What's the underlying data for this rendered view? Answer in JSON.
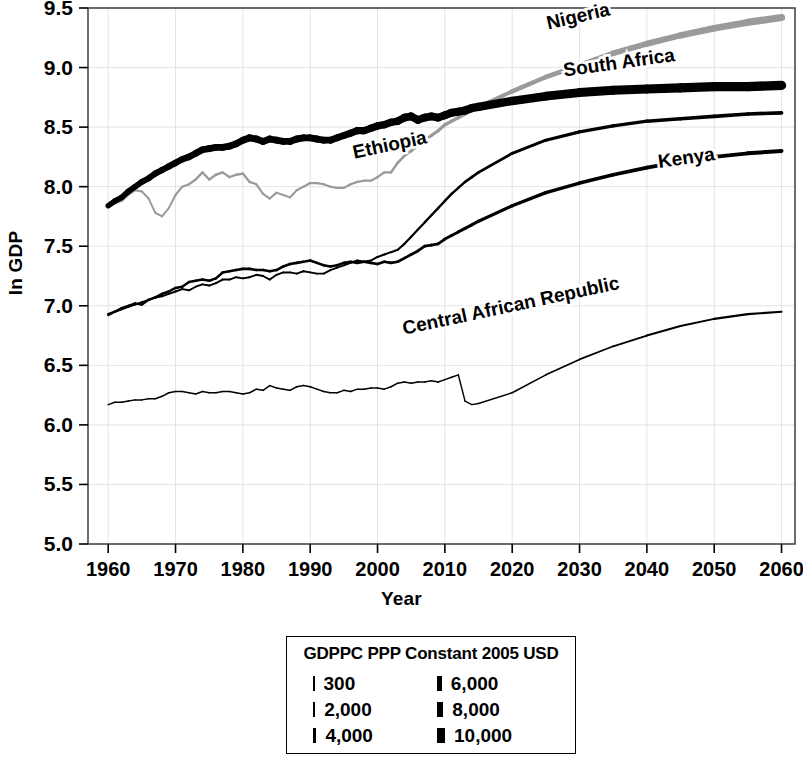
{
  "chart_data": {
    "type": "line",
    "title": "",
    "xlabel": "Year",
    "ylabel": "ln GDP",
    "xlim": [
      1957,
      2062
    ],
    "ylim": [
      5.0,
      9.5
    ],
    "xticks": [
      1960,
      1970,
      1980,
      1990,
      2000,
      2010,
      2020,
      2030,
      2040,
      2050,
      2060
    ],
    "yticks": [
      "5.0",
      "5.5",
      "6.0",
      "6.5",
      "7.0",
      "7.5",
      "8.0",
      "8.5",
      "9.0",
      "9.5"
    ],
    "grid": true,
    "legend_position": "below-plot",
    "encoding_note": "Line width encodes GDP per capita (PPP, constant 2005 USD); line color gray for Nigeria",
    "series": [
      {
        "name": "Nigeria",
        "color": "#9a9a9a",
        "label_x": 2030,
        "label_y": 9.38,
        "label_rotation": -13,
        "x": [
          1960,
          1961,
          1962,
          1963,
          1964,
          1965,
          1966,
          1967,
          1968,
          1969,
          1970,
          1971,
          1972,
          1973,
          1974,
          1975,
          1976,
          1977,
          1978,
          1979,
          1980,
          1981,
          1982,
          1983,
          1984,
          1985,
          1986,
          1987,
          1988,
          1989,
          1990,
          1991,
          1992,
          1993,
          1994,
          1995,
          1996,
          1997,
          1998,
          1999,
          2000,
          2001,
          2002,
          2003,
          2004,
          2005,
          2006,
          2007,
          2008,
          2009,
          2010,
          2011,
          2012,
          2013,
          2014,
          2015,
          2020,
          2025,
          2030,
          2035,
          2040,
          2045,
          2050,
          2055,
          2060
        ],
        "y": [
          7.83,
          7.86,
          7.88,
          7.93,
          7.97,
          7.96,
          7.9,
          7.78,
          7.75,
          7.82,
          7.93,
          8.0,
          8.02,
          8.06,
          8.12,
          8.06,
          8.1,
          8.12,
          8.08,
          8.1,
          8.11,
          8.04,
          8.02,
          7.94,
          7.9,
          7.95,
          7.93,
          7.91,
          7.97,
          8.0,
          8.03,
          8.03,
          8.02,
          8.0,
          7.99,
          7.99,
          8.02,
          8.04,
          8.05,
          8.05,
          8.08,
          8.12,
          8.12,
          8.2,
          8.26,
          8.3,
          8.35,
          8.39,
          8.43,
          8.47,
          8.52,
          8.55,
          8.58,
          8.61,
          8.64,
          8.67,
          8.8,
          8.92,
          9.02,
          9.12,
          9.2,
          9.27,
          9.33,
          9.38,
          9.42
        ],
        "widths": [
          2.0,
          2.0,
          2.0,
          2.1,
          2.1,
          2.1,
          2.0,
          1.9,
          1.9,
          2.0,
          2.1,
          2.2,
          2.2,
          2.3,
          2.4,
          2.3,
          2.4,
          2.4,
          2.3,
          2.4,
          2.4,
          2.3,
          2.2,
          2.1,
          2.0,
          2.1,
          2.1,
          2.0,
          2.1,
          2.2,
          2.2,
          2.2,
          2.2,
          2.1,
          2.1,
          2.1,
          2.2,
          2.2,
          2.2,
          2.2,
          2.3,
          2.4,
          2.4,
          2.6,
          2.7,
          2.8,
          2.9,
          3.0,
          3.1,
          3.2,
          3.3,
          3.4,
          3.5,
          3.6,
          3.7,
          3.8,
          4.2,
          4.6,
          5.0,
          5.4,
          5.8,
          6.2,
          6.6,
          7.0,
          7.4
        ]
      },
      {
        "name": "South Africa",
        "color": "#000000",
        "label_x": 2036,
        "label_y": 8.99,
        "label_rotation": -8,
        "x": [
          1960,
          1961,
          1962,
          1963,
          1964,
          1965,
          1966,
          1967,
          1968,
          1969,
          1970,
          1971,
          1972,
          1973,
          1974,
          1975,
          1976,
          1977,
          1978,
          1979,
          1980,
          1981,
          1982,
          1983,
          1984,
          1985,
          1986,
          1987,
          1988,
          1989,
          1990,
          1991,
          1992,
          1993,
          1994,
          1995,
          1996,
          1997,
          1998,
          1999,
          2000,
          2001,
          2002,
          2003,
          2004,
          2005,
          2006,
          2007,
          2008,
          2009,
          2010,
          2011,
          2012,
          2013,
          2014,
          2015,
          2020,
          2025,
          2030,
          2035,
          2040,
          2045,
          2050,
          2055,
          2060
        ],
        "y": [
          7.84,
          7.88,
          7.91,
          7.96,
          8.0,
          8.04,
          8.07,
          8.11,
          8.14,
          8.17,
          8.2,
          8.23,
          8.25,
          8.28,
          8.31,
          8.32,
          8.33,
          8.33,
          8.34,
          8.36,
          8.39,
          8.41,
          8.4,
          8.38,
          8.4,
          8.39,
          8.38,
          8.38,
          8.4,
          8.41,
          8.41,
          8.4,
          8.39,
          8.39,
          8.41,
          8.43,
          8.45,
          8.47,
          8.47,
          8.49,
          8.51,
          8.52,
          8.54,
          8.55,
          8.58,
          8.59,
          8.56,
          8.58,
          8.59,
          8.58,
          8.6,
          8.62,
          8.63,
          8.64,
          8.66,
          8.67,
          8.72,
          8.76,
          8.79,
          8.81,
          8.82,
          8.83,
          8.84,
          8.84,
          8.85
        ],
        "widths": [
          5.4,
          5.5,
          5.6,
          5.7,
          5.8,
          5.9,
          6.0,
          6.1,
          6.2,
          6.3,
          6.4,
          6.5,
          6.6,
          6.7,
          6.8,
          6.8,
          6.8,
          6.8,
          6.8,
          6.9,
          7.0,
          7.0,
          6.9,
          6.8,
          6.9,
          6.8,
          6.8,
          6.8,
          6.9,
          6.9,
          6.9,
          6.9,
          6.8,
          6.8,
          6.9,
          7.0,
          7.1,
          7.2,
          7.2,
          7.3,
          7.4,
          7.4,
          7.5,
          7.6,
          7.7,
          7.8,
          7.7,
          7.8,
          7.9,
          7.8,
          7.9,
          8.0,
          8.1,
          8.1,
          8.2,
          8.3,
          8.5,
          8.7,
          8.9,
          9.0,
          9.1,
          9.2,
          9.3,
          9.3,
          9.4
        ]
      },
      {
        "name": "Ethiopia",
        "color": "#000000",
        "label_x": 2002,
        "label_y": 8.3,
        "label_rotation": -12,
        "x": [
          1960,
          1961,
          1962,
          1963,
          1964,
          1965,
          1966,
          1967,
          1968,
          1969,
          1970,
          1971,
          1972,
          1973,
          1974,
          1975,
          1976,
          1977,
          1978,
          1979,
          1980,
          1981,
          1982,
          1983,
          1984,
          1985,
          1986,
          1987,
          1988,
          1989,
          1990,
          1991,
          1992,
          1993,
          1994,
          1995,
          1996,
          1997,
          1998,
          1999,
          2000,
          2001,
          2002,
          2003,
          2004,
          2005,
          2006,
          2007,
          2008,
          2009,
          2010,
          2011,
          2012,
          2013,
          2014,
          2015,
          2020,
          2025,
          2030,
          2035,
          2040,
          2045,
          2050,
          2055,
          2060
        ],
        "y": [
          6.92,
          6.95,
          6.97,
          6.99,
          7.01,
          7.03,
          7.05,
          7.07,
          7.08,
          7.1,
          7.12,
          7.14,
          7.13,
          7.16,
          7.18,
          7.17,
          7.19,
          7.22,
          7.22,
          7.24,
          7.23,
          7.24,
          7.26,
          7.25,
          7.22,
          7.26,
          7.28,
          7.28,
          7.27,
          7.29,
          7.28,
          7.27,
          7.27,
          7.3,
          7.32,
          7.34,
          7.36,
          7.38,
          7.37,
          7.38,
          7.41,
          7.43,
          7.45,
          7.47,
          7.52,
          7.58,
          7.64,
          7.7,
          7.76,
          7.82,
          7.88,
          7.94,
          7.99,
          8.04,
          8.08,
          8.12,
          8.28,
          8.39,
          8.46,
          8.51,
          8.55,
          8.57,
          8.59,
          8.61,
          8.62
        ],
        "widths": [
          1.9,
          1.9,
          1.9,
          1.9,
          1.9,
          1.9,
          1.9,
          1.9,
          1.9,
          1.9,
          1.9,
          1.9,
          1.9,
          1.9,
          1.9,
          1.9,
          1.9,
          1.9,
          1.9,
          1.9,
          1.9,
          1.9,
          1.9,
          1.9,
          1.9,
          1.9,
          1.9,
          1.9,
          1.9,
          1.9,
          1.9,
          1.9,
          1.9,
          1.9,
          1.9,
          1.9,
          2.0,
          2.0,
          2.0,
          2.0,
          2.0,
          2.0,
          2.0,
          2.1,
          2.1,
          2.2,
          2.2,
          2.3,
          2.3,
          2.4,
          2.4,
          2.5,
          2.5,
          2.6,
          2.6,
          2.7,
          2.9,
          3.1,
          3.2,
          3.3,
          3.4,
          3.5,
          3.6,
          3.6,
          3.7
        ]
      },
      {
        "name": "Kenya",
        "color": "#000000",
        "label_x": 2046,
        "label_y": 8.19,
        "label_rotation": -8,
        "x": [
          1960,
          1961,
          1962,
          1963,
          1964,
          1965,
          1966,
          1967,
          1968,
          1969,
          1970,
          1971,
          1972,
          1973,
          1974,
          1975,
          1976,
          1977,
          1978,
          1979,
          1980,
          1981,
          1982,
          1983,
          1984,
          1985,
          1986,
          1987,
          1988,
          1989,
          1990,
          1991,
          1992,
          1993,
          1994,
          1995,
          1996,
          1997,
          1998,
          1999,
          2000,
          2001,
          2002,
          2003,
          2004,
          2005,
          2006,
          2007,
          2008,
          2009,
          2010,
          2011,
          2012,
          2013,
          2014,
          2015,
          2020,
          2025,
          2030,
          2035,
          2040,
          2045,
          2050,
          2055,
          2060
        ],
        "y": [
          6.93,
          6.95,
          6.98,
          7.0,
          7.02,
          7.01,
          7.05,
          7.07,
          7.1,
          7.12,
          7.15,
          7.16,
          7.2,
          7.21,
          7.22,
          7.21,
          7.23,
          7.28,
          7.29,
          7.3,
          7.31,
          7.31,
          7.3,
          7.3,
          7.29,
          7.3,
          7.33,
          7.35,
          7.36,
          7.37,
          7.38,
          7.36,
          7.34,
          7.33,
          7.34,
          7.36,
          7.37,
          7.36,
          7.37,
          7.36,
          7.35,
          7.37,
          7.36,
          7.37,
          7.4,
          7.43,
          7.46,
          7.5,
          7.51,
          7.52,
          7.56,
          7.59,
          7.62,
          7.65,
          7.68,
          7.71,
          7.84,
          7.95,
          8.03,
          8.1,
          8.16,
          8.21,
          8.25,
          8.28,
          8.3
        ],
        "widths": [
          2.4,
          2.4,
          2.4,
          2.4,
          2.4,
          2.4,
          2.4,
          2.5,
          2.5,
          2.5,
          2.5,
          2.5,
          2.5,
          2.5,
          2.5,
          2.5,
          2.5,
          2.6,
          2.6,
          2.6,
          2.6,
          2.6,
          2.6,
          2.6,
          2.6,
          2.6,
          2.6,
          2.6,
          2.6,
          2.6,
          2.6,
          2.6,
          2.6,
          2.6,
          2.6,
          2.6,
          2.6,
          2.6,
          2.6,
          2.6,
          2.6,
          2.6,
          2.6,
          2.6,
          2.7,
          2.7,
          2.7,
          2.8,
          2.8,
          2.8,
          2.9,
          2.9,
          3.0,
          3.0,
          3.1,
          3.1,
          3.3,
          3.4,
          3.5,
          3.6,
          3.7,
          3.8,
          3.9,
          3.9,
          4.0
        ]
      },
      {
        "name": "Central African Republic",
        "color": "#000000",
        "label_x": 2020,
        "label_y": 6.95,
        "label_rotation": -12,
        "x": [
          1960,
          1961,
          1962,
          1963,
          1964,
          1965,
          1966,
          1967,
          1968,
          1969,
          1970,
          1971,
          1972,
          1973,
          1974,
          1975,
          1976,
          1977,
          1978,
          1979,
          1980,
          1981,
          1982,
          1983,
          1984,
          1985,
          1986,
          1987,
          1988,
          1989,
          1990,
          1991,
          1992,
          1993,
          1994,
          1995,
          1996,
          1997,
          1998,
          1999,
          2000,
          2001,
          2002,
          2003,
          2004,
          2005,
          2006,
          2007,
          2008,
          2009,
          2010,
          2011,
          2012,
          2013,
          2014,
          2015,
          2020,
          2025,
          2030,
          2035,
          2040,
          2045,
          2050,
          2055,
          2060
        ],
        "y": [
          6.17,
          6.19,
          6.19,
          6.2,
          6.21,
          6.21,
          6.22,
          6.22,
          6.24,
          6.27,
          6.28,
          6.28,
          6.27,
          6.26,
          6.28,
          6.27,
          6.27,
          6.28,
          6.28,
          6.27,
          6.26,
          6.27,
          6.3,
          6.29,
          6.33,
          6.31,
          6.3,
          6.29,
          6.32,
          6.33,
          6.32,
          6.3,
          6.28,
          6.27,
          6.27,
          6.29,
          6.28,
          6.3,
          6.3,
          6.31,
          6.31,
          6.3,
          6.32,
          6.35,
          6.36,
          6.35,
          6.36,
          6.36,
          6.37,
          6.36,
          6.38,
          6.4,
          6.42,
          6.2,
          6.17,
          6.18,
          6.27,
          6.42,
          6.55,
          6.66,
          6.75,
          6.83,
          6.89,
          6.93,
          6.95
        ],
        "widths": [
          1.5,
          1.5,
          1.5,
          1.5,
          1.5,
          1.5,
          1.5,
          1.5,
          1.5,
          1.5,
          1.5,
          1.5,
          1.5,
          1.5,
          1.5,
          1.5,
          1.5,
          1.5,
          1.5,
          1.5,
          1.5,
          1.5,
          1.5,
          1.5,
          1.5,
          1.5,
          1.5,
          1.5,
          1.5,
          1.5,
          1.5,
          1.5,
          1.5,
          1.5,
          1.5,
          1.5,
          1.5,
          1.5,
          1.5,
          1.5,
          1.5,
          1.5,
          1.5,
          1.5,
          1.5,
          1.5,
          1.5,
          1.5,
          1.5,
          1.5,
          1.5,
          1.5,
          1.5,
          1.4,
          1.4,
          1.4,
          1.5,
          1.6,
          1.7,
          1.8,
          1.9,
          2.0,
          2.0,
          2.1,
          2.1
        ]
      }
    ]
  },
  "legend": {
    "title": "GDPPC PPP Constant 2005 USD",
    "items": [
      {
        "label": "300",
        "width": 1.5
      },
      {
        "label": "2,000",
        "width": 2.2
      },
      {
        "label": "4,000",
        "width": 3.4
      },
      {
        "label": "6,000",
        "width": 4.8
      },
      {
        "label": "8,000",
        "width": 6.3
      },
      {
        "label": "10,000",
        "width": 8.0
      }
    ]
  }
}
